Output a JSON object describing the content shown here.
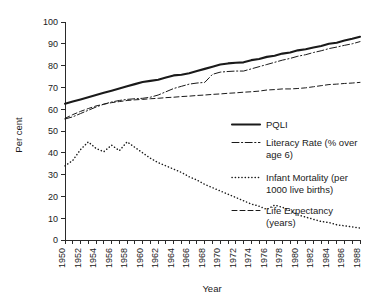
{
  "chart_data": {
    "type": "line",
    "title": "",
    "xlabel": "Year",
    "ylabel": "Per cent",
    "xlim": [
      1950,
      1988
    ],
    "ylim": [
      0,
      100
    ],
    "grid": false,
    "legend_position": "right",
    "y_ticks": [
      0,
      10,
      20,
      30,
      40,
      50,
      60,
      70,
      80,
      90,
      100
    ],
    "x_ticks_labeled": [
      1950,
      1952,
      1954,
      1956,
      1958,
      1960,
      1962,
      1964,
      1966,
      1968,
      1970,
      1972,
      1974,
      1976,
      1978,
      1980,
      1982,
      1984,
      1986,
      1988
    ],
    "x_tick_step_minor": 1,
    "x": [
      1950,
      1951,
      1952,
      1953,
      1954,
      1955,
      1956,
      1957,
      1958,
      1959,
      1960,
      1961,
      1962,
      1963,
      1964,
      1965,
      1966,
      1967,
      1968,
      1969,
      1970,
      1971,
      1972,
      1973,
      1974,
      1975,
      1976,
      1977,
      1978,
      1979,
      1980,
      1981,
      1982,
      1983,
      1984,
      1985,
      1986,
      1987,
      1988
    ],
    "series": [
      {
        "name": "PQLI",
        "style": "solid",
        "values": [
          62.5,
          63.5,
          64.5,
          65.5,
          66.5,
          67.5,
          68.5,
          69.5,
          70.5,
          71.5,
          72.5,
          73.0,
          73.5,
          74.5,
          75.5,
          75.8,
          76.5,
          77.5,
          78.5,
          79.5,
          80.5,
          81.0,
          81.3,
          81.5,
          82.5,
          83.0,
          84.0,
          84.5,
          85.5,
          86.0,
          87.0,
          87.5,
          88.3,
          89.0,
          90.0,
          90.5,
          91.5,
          92.3,
          93.2
        ]
      },
      {
        "name": "Literacy Rate (% over age 6)",
        "style": "dash-dot",
        "values": [
          55.5,
          56.5,
          58.0,
          59.5,
          61.0,
          62.3,
          63.3,
          64.0,
          64.5,
          64.8,
          65.0,
          65.5,
          66.5,
          68.0,
          69.5,
          70.5,
          71.5,
          72.0,
          72.3,
          76.0,
          77.0,
          77.3,
          77.5,
          77.5,
          78.5,
          79.5,
          80.5,
          81.5,
          82.5,
          83.3,
          84.3,
          85.0,
          86.0,
          86.8,
          87.8,
          88.5,
          89.3,
          90.0,
          91.0
        ]
      },
      {
        "name": "Infant Mortality (per 1000 live births)",
        "style": "dotted",
        "values": [
          34.0,
          36.5,
          41.5,
          45.0,
          42.0,
          40.5,
          43.5,
          41.0,
          45.0,
          42.5,
          40.0,
          37.5,
          35.5,
          34.0,
          32.5,
          31.0,
          29.0,
          27.5,
          25.5,
          24.0,
          22.5,
          21.0,
          19.5,
          18.0,
          16.5,
          15.5,
          14.0,
          16.0,
          15.0,
          13.5,
          11.5,
          10.5,
          9.5,
          8.5,
          8.0,
          7.0,
          6.5,
          6.0,
          5.5
        ]
      },
      {
        "name": "Life Expectancy (years)",
        "style": "dashed",
        "values": [
          55.8,
          57.5,
          59.0,
          60.3,
          61.5,
          62.3,
          63.0,
          63.5,
          64.0,
          64.3,
          64.5,
          64.8,
          65.0,
          65.3,
          65.5,
          65.8,
          66.0,
          66.3,
          66.5,
          66.8,
          67.0,
          67.3,
          67.5,
          67.8,
          68.0,
          68.3,
          68.8,
          69.0,
          69.3,
          69.3,
          69.5,
          69.8,
          70.3,
          70.8,
          71.3,
          71.5,
          71.8,
          72.0,
          72.3
        ]
      }
    ]
  },
  "legend": {
    "entries": [
      {
        "label_line1": "PQLI",
        "label_line2": ""
      },
      {
        "label_line1": "Literacy Rate (% over",
        "label_line2": "age 6)"
      },
      {
        "label_line1": "Infant Mortality (per",
        "label_line2": "1000 live births)"
      },
      {
        "label_line1": "Life Expectancy",
        "label_line2": "(years)"
      }
    ]
  }
}
